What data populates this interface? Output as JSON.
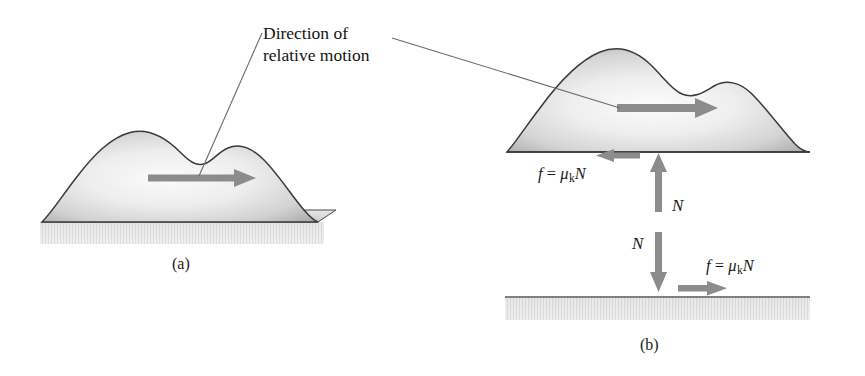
{
  "figure": {
    "type": "physics-diagram",
    "background_color": "#ffffff",
    "ink_color": "#1a1a1a",
    "arrow_color": "#8c8c8c",
    "block_fill_light": "#f2f2f2",
    "block_fill_dark": "#a8a8a8",
    "ground_fill": "#e3e3e3"
  },
  "caption": {
    "line1": "Direction of",
    "line2": "relative motion"
  },
  "panels": [
    {
      "id": "a",
      "label": "(a)"
    },
    {
      "id": "b",
      "label": "(b)"
    }
  ],
  "labels": {
    "panel_a": "(a)",
    "panel_b": "(b)"
  },
  "equations": {
    "friction_top": {
      "f": "f",
      "equals": "=",
      "mu": "μ",
      "subscript": "k",
      "normal": "N",
      "full": "f = μ k N"
    },
    "friction_bottom": {
      "f": "f",
      "equals": "=",
      "mu": "μ",
      "subscript": "k",
      "normal": "N",
      "full": "f = μ k N"
    }
  },
  "force_labels": {
    "normal_up": "N",
    "normal_down": "N"
  },
  "arrows": [
    {
      "name": "motion-arrow-panel-a",
      "direction": "right",
      "label": ""
    },
    {
      "name": "motion-arrow-panel-b",
      "direction": "right",
      "label": ""
    },
    {
      "name": "friction-arrow-on-block",
      "direction": "left",
      "label": "f = μ k N"
    },
    {
      "name": "normal-force-arrow-up",
      "direction": "up",
      "label": "N"
    },
    {
      "name": "normal-force-arrow-down",
      "direction": "down",
      "label": "N"
    },
    {
      "name": "friction-arrow-on-surface",
      "direction": "right",
      "label": "f = μ k N"
    }
  ]
}
